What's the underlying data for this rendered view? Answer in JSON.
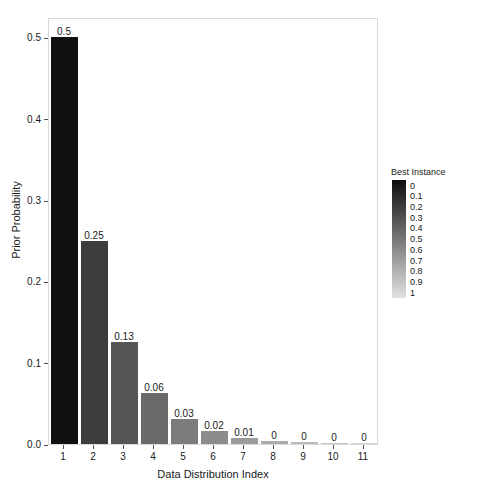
{
  "chart_data": {
    "type": "bar",
    "title": "",
    "subtitle": "",
    "xlabel": "Data Distribution Index",
    "ylabel": "Prior Probability",
    "categories": [
      "1",
      "2",
      "3",
      "4",
      "5",
      "6",
      "7",
      "8",
      "9",
      "10",
      "11"
    ],
    "values": [
      0.5,
      0.25,
      0.125,
      0.0625,
      0.03125,
      0.015625,
      0.0078125,
      0.00390625,
      0.001953125,
      0.0009765625,
      0.00048828125
    ],
    "data_labels": [
      "0.5",
      "0.25",
      "0.13",
      "0.06",
      "0.03",
      "0.02",
      "0.01",
      "0",
      "0",
      "0",
      "0"
    ],
    "bar_colors": [
      "#101010",
      "#3d3d3d",
      "#565656",
      "#6a6a6a",
      "#7c7c7c",
      "#8c8c8c",
      "#9c9c9c",
      "#ababab",
      "#b9b9b9",
      "#c6c6c6",
      "#d2d2d2"
    ],
    "ylim": [
      0.0,
      0.525
    ],
    "xlim": [
      0.5,
      11.5
    ],
    "yticks": [
      0.0,
      0.1,
      0.2,
      0.3,
      0.4,
      0.5
    ],
    "ytick_labels": [
      "0.0",
      "0.1",
      "0.2",
      "0.3",
      "0.4",
      "0.5"
    ],
    "xticks": [
      1,
      2,
      3,
      4,
      5,
      6,
      7,
      8,
      9,
      10,
      11
    ],
    "xtick_labels": [
      "1",
      "2",
      "3",
      "4",
      "5",
      "6",
      "7",
      "8",
      "9",
      "10",
      "11"
    ],
    "grid": false,
    "legend": {
      "position": "right",
      "title": "Best Instance",
      "type": "continuous-colorbar",
      "ticks": [
        "0",
        "0.1",
        "0.2",
        "0.3",
        "0.4",
        "0.5",
        "0.6",
        "0.7",
        "0.8",
        "0.9",
        "1"
      ],
      "gradient_start_color": "#0d0d0d",
      "gradient_end_color": "#e2e2e2"
    },
    "panel": {
      "background_color": "#ffffff",
      "border_color": "#d9d9d9"
    },
    "axis_text_color": "#1a1a1a"
  }
}
